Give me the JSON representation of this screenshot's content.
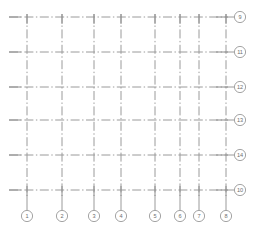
{
  "drawing": {
    "title": "Structural column grid plan",
    "background_color": "#ffffff",
    "line_color": "#9a9a9a",
    "line_style": "dash-dot chain line",
    "bubble_fill": "#ffffff",
    "bubble_stroke": "#9a9a9a",
    "text_color": "#6e6e6e",
    "width": 256,
    "height": 229
  },
  "vertical_axes": [
    {
      "label": "1",
      "x": 27,
      "top": 14,
      "bottom": 196,
      "bubble_cx": 27,
      "bubble_cy": 216
    },
    {
      "label": "2",
      "x": 62,
      "top": 14,
      "bottom": 196,
      "bubble_cx": 62,
      "bubble_cy": 216
    },
    {
      "label": "3",
      "x": 94,
      "top": 14,
      "bottom": 196,
      "bubble_cx": 94,
      "bubble_cy": 216
    },
    {
      "label": "4",
      "x": 121,
      "top": 14,
      "bottom": 196,
      "bubble_cx": 121,
      "bubble_cy": 216
    },
    {
      "label": "5",
      "x": 155,
      "top": 14,
      "bottom": 196,
      "bubble_cx": 155,
      "bubble_cy": 216
    },
    {
      "label": "6",
      "x": 180,
      "top": 14,
      "bottom": 196,
      "bubble_cx": 180,
      "bubble_cy": 216
    },
    {
      "label": "7",
      "x": 199,
      "top": 14,
      "bottom": 196,
      "bubble_cx": 199,
      "bubble_cy": 216
    },
    {
      "label": "8",
      "x": 226,
      "top": 14,
      "bottom": 196,
      "bubble_cx": 226,
      "bubble_cy": 216
    }
  ],
  "horizontal_axes": [
    {
      "label": "9",
      "y": 17,
      "left": 9,
      "right": 228,
      "bubble_cx": 240,
      "bubble_cy": 17
    },
    {
      "label": "11",
      "y": 52,
      "left": 9,
      "right": 228,
      "bubble_cx": 240,
      "bubble_cy": 52
    },
    {
      "label": "12",
      "y": 87,
      "left": 9,
      "right": 228,
      "bubble_cx": 240,
      "bubble_cy": 87
    },
    {
      "label": "13",
      "y": 120,
      "left": 9,
      "right": 228,
      "bubble_cx": 240,
      "bubble_cy": 120
    },
    {
      "label": "14",
      "y": 155,
      "left": 9,
      "right": 228,
      "bubble_cx": 240,
      "bubble_cy": 155
    },
    {
      "label": "10",
      "y": 190,
      "left": 9,
      "right": 228,
      "bubble_cx": 240,
      "bubble_cy": 190
    }
  ],
  "bubble": {
    "radius": 5.6,
    "leader_length_bottom": 14,
    "leader_length_right": 7
  }
}
